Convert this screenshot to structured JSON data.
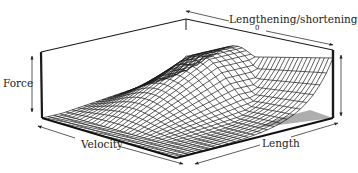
{
  "figure": {
    "axes": {
      "vertical_label": "Force",
      "depth_label": "Lengthening/shortening",
      "depth_zero_tick": "0",
      "left_front_label": "Velocity",
      "right_front_label": "Length"
    },
    "colors": {
      "line": "#1a1a1a",
      "background": "#ffffff",
      "floor_shade": "#9a9a9a"
    }
  },
  "chart_data": {
    "type": "surface",
    "title": "",
    "xlabel": "Length",
    "ylabel": "Velocity (Lengthening/shortening)",
    "zlabel": "Force",
    "y_tick_labels": [
      "0"
    ],
    "grid": true,
    "legend": null
  }
}
